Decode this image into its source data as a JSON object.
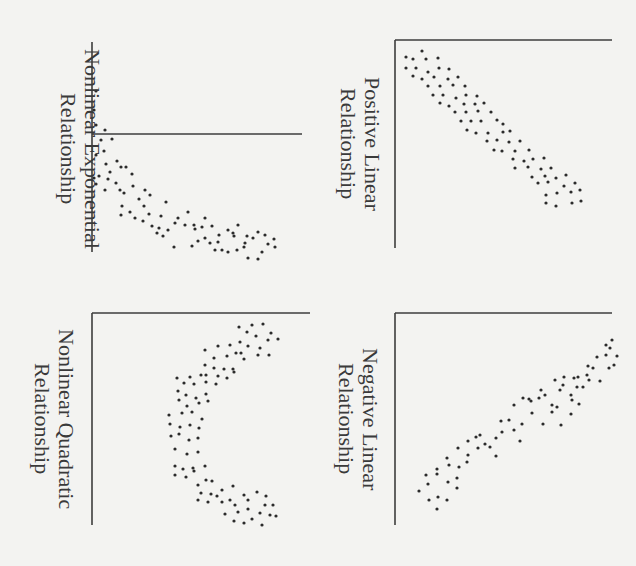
{
  "chart_data": [
    {
      "type": "scatter",
      "title": "Nonlinear Exponential Relationship",
      "title_lines": [
        "Nonlinear Exponential",
        "Relationship"
      ],
      "orientation": "rotated 90deg clockwise",
      "axes": {
        "vertical_axis_x": 92,
        "vertical_axis_y": [
          42,
          252
        ],
        "horizontal_axis_y": 134,
        "horizontal_axis_x": [
          92,
          302
        ]
      },
      "description": "Points decay exponentially; dense steep start near axis then flattening tail",
      "points": [
        [
          96,
          91
        ],
        [
          94,
          110
        ],
        [
          96,
          125
        ],
        [
          105,
          130
        ],
        [
          101,
          140
        ],
        [
          112,
          139
        ],
        [
          96,
          155
        ],
        [
          104,
          151
        ],
        [
          106,
          164
        ],
        [
          117,
          161
        ],
        [
          99,
          176
        ],
        [
          110,
          172
        ],
        [
          96,
          184
        ],
        [
          121,
          167
        ],
        [
          94,
          178
        ],
        [
          108,
          179
        ],
        [
          105,
          190
        ],
        [
          116,
          183
        ],
        [
          126,
          167
        ],
        [
          132,
          174
        ],
        [
          120,
          190
        ],
        [
          124,
          193
        ],
        [
          133,
          186
        ],
        [
          139,
          199
        ],
        [
          145,
          190
        ],
        [
          150,
          195
        ],
        [
          144,
          206
        ],
        [
          122,
          206
        ],
        [
          130,
          212
        ],
        [
          143,
          221
        ],
        [
          149,
          214
        ],
        [
          161,
          216
        ],
        [
          121,
          215
        ],
        [
          135,
          218
        ],
        [
          152,
          226
        ],
        [
          166,
          202
        ],
        [
          175,
          223
        ],
        [
          178,
          218
        ],
        [
          159,
          228
        ],
        [
          157,
          233
        ],
        [
          163,
          236
        ],
        [
          168,
          230
        ],
        [
          174,
          247
        ],
        [
          188,
          212
        ],
        [
          185,
          225
        ],
        [
          192,
          246
        ],
        [
          198,
          241
        ],
        [
          195,
          229
        ],
        [
          194,
          225
        ],
        [
          202,
          227
        ],
        [
          205,
          238
        ],
        [
          210,
          243
        ],
        [
          212,
          226
        ],
        [
          219,
          235
        ],
        [
          218,
          242
        ],
        [
          228,
          230
        ],
        [
          233,
          233
        ],
        [
          222,
          250
        ],
        [
          237,
          250
        ],
        [
          245,
          243
        ],
        [
          247,
          236
        ],
        [
          253,
          238
        ],
        [
          248,
          258
        ],
        [
          258,
          259
        ],
        [
          262,
          252
        ],
        [
          258,
          232
        ],
        [
          268,
          244
        ],
        [
          275,
          247
        ],
        [
          265,
          235
        ],
        [
          274,
          239
        ],
        [
          228,
          252
        ],
        [
          238,
          225
        ],
        [
          244,
          247
        ],
        [
          234,
          236
        ],
        [
          205,
          218
        ],
        [
          215,
          250
        ]
      ]
    },
    {
      "type": "scatter",
      "title": "Positive Linear Relationship",
      "title_lines": [
        "Positive Linear",
        "Relationship"
      ],
      "orientation": "rotated 90deg clockwise",
      "axes": {
        "vertical_axis_x": 395,
        "vertical_axis_y": [
          40,
          248
        ],
        "horizontal_axis_y": 40,
        "horizontal_axis_x": [
          395,
          612
        ]
      },
      "description": "Tight diagonal band of points running from upper-left to lower-right",
      "points": [
        [
          406,
          57
        ],
        [
          413,
          59
        ],
        [
          422,
          51
        ],
        [
          426,
          59
        ],
        [
          438,
          58
        ],
        [
          406,
          68
        ],
        [
          416,
          68
        ],
        [
          428,
          72
        ],
        [
          439,
          68
        ],
        [
          449,
          69
        ],
        [
          413,
          76
        ],
        [
          422,
          79
        ],
        [
          434,
          77
        ],
        [
          448,
          79
        ],
        [
          458,
          77
        ],
        [
          428,
          86
        ],
        [
          440,
          86
        ],
        [
          453,
          85
        ],
        [
          465,
          86
        ],
        [
          433,
          95
        ],
        [
          443,
          95
        ],
        [
          456,
          98
        ],
        [
          466,
          95
        ],
        [
          477,
          96
        ],
        [
          440,
          103
        ],
        [
          449,
          106
        ],
        [
          464,
          104
        ],
        [
          475,
          104
        ],
        [
          484,
          103
        ],
        [
          455,
          112
        ],
        [
          466,
          112
        ],
        [
          478,
          111
        ],
        [
          491,
          112
        ],
        [
          461,
          121
        ],
        [
          471,
          121
        ],
        [
          481,
          121
        ],
        [
          497,
          120
        ],
        [
          503,
          124
        ],
        [
          467,
          130
        ],
        [
          476,
          133
        ],
        [
          488,
          133
        ],
        [
          503,
          132
        ],
        [
          510,
          131
        ],
        [
          487,
          141
        ],
        [
          497,
          140
        ],
        [
          509,
          142
        ],
        [
          520,
          141
        ],
        [
          494,
          150
        ],
        [
          502,
          151
        ],
        [
          515,
          151
        ],
        [
          529,
          150
        ],
        [
          513,
          159
        ],
        [
          524,
          161
        ],
        [
          533,
          159
        ],
        [
          544,
          158
        ],
        [
          515,
          168
        ],
        [
          528,
          167
        ],
        [
          541,
          169
        ],
        [
          551,
          168
        ],
        [
          532,
          177
        ],
        [
          545,
          176
        ],
        [
          556,
          178
        ],
        [
          566,
          175
        ],
        [
          538,
          183
        ],
        [
          548,
          182
        ],
        [
          564,
          186
        ],
        [
          575,
          183
        ],
        [
          546,
          195
        ],
        [
          557,
          193
        ],
        [
          571,
          192
        ],
        [
          546,
          203
        ],
        [
          556,
          206
        ],
        [
          572,
          203
        ],
        [
          580,
          190
        ],
        [
          581,
          201
        ]
      ]
    },
    {
      "type": "scatter",
      "title": "Nonlinear Quadratic Relationship",
      "title_lines": [
        "Nonlinear Quadratic",
        "Relationship"
      ],
      "orientation": "rotated 90deg clockwise",
      "axes": {
        "vertical_axis_x": 92,
        "vertical_axis_y": [
          313,
          525
        ],
        "horizontal_axis_y": 313,
        "horizontal_axis_x": [
          92,
          310
        ]
      },
      "description": "Curved U-shaped (rotated) band: points bow toward the axis in the middle and move away at both ends",
      "points": [
        [
          239,
          327
        ],
        [
          252,
          325
        ],
        [
          263,
          324
        ],
        [
          247,
          332
        ],
        [
          256,
          336
        ],
        [
          271,
          333
        ],
        [
          240,
          342
        ],
        [
          248,
          346
        ],
        [
          260,
          348
        ],
        [
          268,
          340
        ],
        [
          278,
          339
        ],
        [
          258,
          355
        ],
        [
          269,
          355
        ],
        [
          241,
          353
        ],
        [
          205,
          350
        ],
        [
          218,
          346
        ],
        [
          230,
          345
        ],
        [
          214,
          358
        ],
        [
          227,
          356
        ],
        [
          236,
          353
        ],
        [
          244,
          359
        ],
        [
          205,
          365
        ],
        [
          214,
          368
        ],
        [
          224,
          369
        ],
        [
          233,
          369
        ],
        [
          206,
          375
        ],
        [
          218,
          376
        ],
        [
          227,
          378
        ],
        [
          234,
          372
        ],
        [
          177,
          378
        ],
        [
          190,
          377
        ],
        [
          201,
          375
        ],
        [
          184,
          383
        ],
        [
          194,
          384
        ],
        [
          206,
          382
        ],
        [
          216,
          384
        ],
        [
          178,
          391
        ],
        [
          186,
          395
        ],
        [
          196,
          398
        ],
        [
          206,
          394
        ],
        [
          179,
          400
        ],
        [
          187,
          406
        ],
        [
          199,
          403
        ],
        [
          208,
          401
        ],
        [
          169,
          415
        ],
        [
          182,
          413
        ],
        [
          192,
          412
        ],
        [
          202,
          419
        ],
        [
          170,
          424
        ],
        [
          180,
          427
        ],
        [
          190,
          425
        ],
        [
          199,
          428
        ],
        [
          171,
          436
        ],
        [
          179,
          434
        ],
        [
          189,
          440
        ],
        [
          198,
          438
        ],
        [
          175,
          449
        ],
        [
          187,
          454
        ],
        [
          198,
          452
        ],
        [
          175,
          466
        ],
        [
          183,
          469
        ],
        [
          193,
          468
        ],
        [
          205,
          466
        ],
        [
          175,
          475
        ],
        [
          186,
          477
        ],
        [
          194,
          471
        ],
        [
          206,
          480
        ],
        [
          198,
          485
        ],
        [
          212,
          481
        ],
        [
          201,
          493
        ],
        [
          211,
          494
        ],
        [
          222,
          490
        ],
        [
          233,
          486
        ],
        [
          198,
          500
        ],
        [
          208,
          502
        ],
        [
          217,
          496
        ],
        [
          230,
          500
        ],
        [
          235,
          505
        ],
        [
          244,
          495
        ],
        [
          248,
          500
        ],
        [
          257,
          492
        ],
        [
          265,
          505
        ],
        [
          270,
          515
        ],
        [
          248,
          509
        ],
        [
          252,
          519
        ],
        [
          262,
          525
        ],
        [
          266,
          496
        ],
        [
          273,
          505
        ],
        [
          276,
          516
        ],
        [
          260,
          513
        ],
        [
          222,
          502
        ],
        [
          225,
          514
        ],
        [
          234,
          521
        ],
        [
          244,
          523
        ],
        [
          238,
          512
        ]
      ]
    },
    {
      "type": "scatter",
      "title": "Negative Linear Relationship",
      "title_lines": [
        "Negative Linear",
        "Relationship"
      ],
      "orientation": "rotated 90deg clockwise",
      "axes": {
        "vertical_axis_x": 395,
        "vertical_axis_y": [
          313,
          525
        ],
        "horizontal_axis_y": 313,
        "horizontal_axis_x": [
          395,
          612
        ]
      },
      "description": "Tight diagonal band of points running from lower-left to upper-right",
      "points": [
        [
          419,
          491
        ],
        [
          428,
          484
        ],
        [
          429,
          500
        ],
        [
          438,
          497
        ],
        [
          437,
          509
        ],
        [
          447,
          500
        ],
        [
          426,
          475
        ],
        [
          437,
          474
        ],
        [
          448,
          482
        ],
        [
          457,
          478
        ],
        [
          447,
          458
        ],
        [
          437,
          469
        ],
        [
          449,
          465
        ],
        [
          459,
          467
        ],
        [
          467,
          462
        ],
        [
          458,
          448
        ],
        [
          457,
          488
        ],
        [
          468,
          455
        ],
        [
          478,
          448
        ],
        [
          480,
          435
        ],
        [
          468,
          441
        ],
        [
          476,
          437
        ],
        [
          485,
          444
        ],
        [
          490,
          447
        ],
        [
          496,
          438
        ],
        [
          496,
          456
        ],
        [
          502,
          432
        ],
        [
          501,
          421
        ],
        [
          509,
          420
        ],
        [
          514,
          430
        ],
        [
          520,
          441
        ],
        [
          522,
          424
        ],
        [
          532,
          413
        ],
        [
          531,
          401
        ],
        [
          514,
          405
        ],
        [
          523,
          398
        ],
        [
          529,
          399
        ],
        [
          541,
          390
        ],
        [
          539,
          398
        ],
        [
          545,
          395
        ],
        [
          552,
          405
        ],
        [
          543,
          424
        ],
        [
          552,
          412
        ],
        [
          557,
          407
        ],
        [
          560,
          390
        ],
        [
          563,
          385
        ],
        [
          571,
          395
        ],
        [
          572,
          400
        ],
        [
          577,
          387
        ],
        [
          578,
          377
        ],
        [
          574,
          378
        ],
        [
          587,
          375
        ],
        [
          588,
          366
        ],
        [
          593,
          368
        ],
        [
          589,
          380
        ],
        [
          583,
          387
        ],
        [
          609,
          368
        ],
        [
          606,
          355
        ],
        [
          597,
          357
        ],
        [
          606,
          345
        ],
        [
          612,
          340
        ],
        [
          610,
          348
        ],
        [
          617,
          356
        ],
        [
          614,
          365
        ],
        [
          600,
          381
        ],
        [
          564,
          377
        ],
        [
          555,
          380
        ],
        [
          579,
          404
        ],
        [
          571,
          414
        ],
        [
          561,
          425
        ]
      ]
    }
  ],
  "style": {
    "background": "#f3f3f1",
    "axis_color": "#3d3d3d",
    "dot_color": "#2b2b2b",
    "label_color": "#3a3a3a"
  }
}
